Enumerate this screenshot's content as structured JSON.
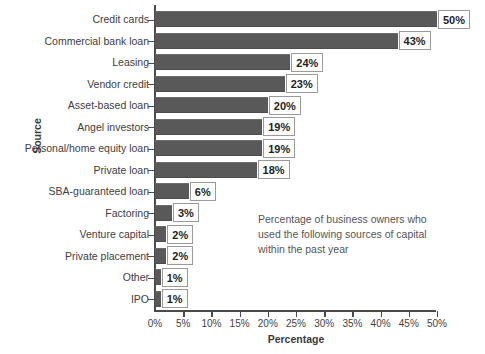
{
  "chart_data": {
    "type": "bar",
    "orientation": "horizontal",
    "title": "",
    "xlabel": "Percentage",
    "ylabel": "Source",
    "xlim": [
      0,
      50
    ],
    "grid": false,
    "legend": null,
    "bar_color": "#595959",
    "categories": [
      "Credit cards",
      "Commercial bank loan",
      "Leasing",
      "Vendor credit",
      "Asset-based loan",
      "Angel investors",
      "Personal/home equity loan",
      "Private loan",
      "SBA-guaranteed loan",
      "Factoring",
      "Venture capital",
      "Private placement",
      "Other",
      "IPO"
    ],
    "values": [
      50,
      43,
      24,
      23,
      20,
      19,
      19,
      18,
      6,
      3,
      2,
      2,
      1,
      1
    ],
    "data_labels": [
      "50%",
      "43%",
      "24%",
      "23%",
      "20%",
      "19%",
      "19%",
      "18%",
      "6%",
      "3%",
      "2%",
      "2%",
      "1%",
      "1%"
    ],
    "xticks": [
      0,
      5,
      10,
      15,
      20,
      25,
      30,
      35,
      40,
      45,
      50
    ],
    "xtick_labels": [
      "0%",
      "5%",
      "10%",
      "15%",
      "20%",
      "25%",
      "30%",
      "35%",
      "40%",
      "45%",
      "50%"
    ],
    "annotation": [
      "Percentage of business owners who",
      "used the following sources of capital",
      "within the past year"
    ]
  }
}
